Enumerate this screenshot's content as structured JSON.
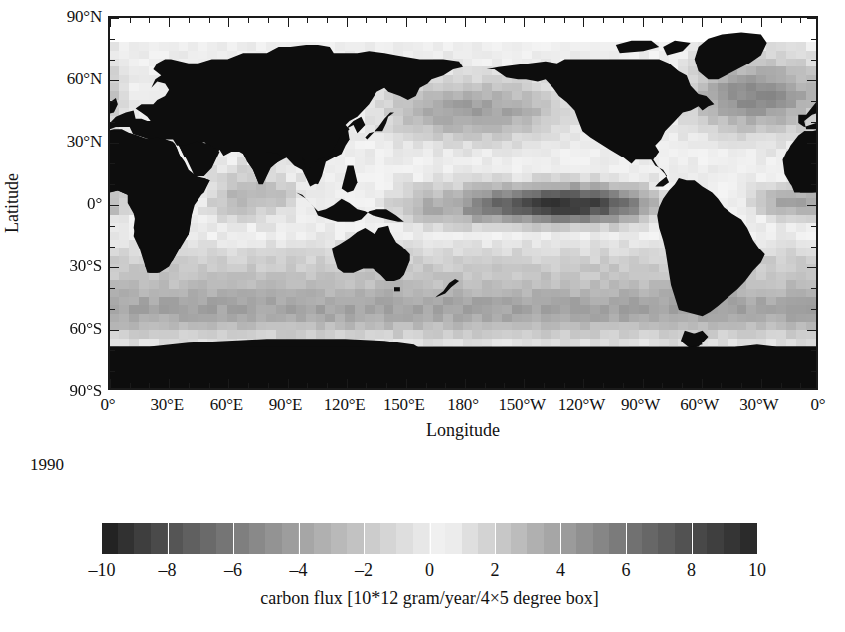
{
  "figure": {
    "year_annotation": "1990"
  },
  "axes": {
    "xlabel": "Longitude",
    "ylabel": "Latitude",
    "xticks": [
      {
        "label": "0°",
        "value": 0
      },
      {
        "label": "30°E",
        "value": 30
      },
      {
        "label": "60°E",
        "value": 60
      },
      {
        "label": "90°E",
        "value": 90
      },
      {
        "label": "120°E",
        "value": 120
      },
      {
        "label": "150°E",
        "value": 150
      },
      {
        "label": "180°",
        "value": 180
      },
      {
        "label": "150°W",
        "value": 210
      },
      {
        "label": "120°W",
        "value": 240
      },
      {
        "label": "90°W",
        "value": 270
      },
      {
        "label": "60°W",
        "value": 300
      },
      {
        "label": "30°W",
        "value": 330
      },
      {
        "label": "0°",
        "value": 360
      }
    ],
    "yticks": [
      {
        "label": "90°N",
        "value": 90
      },
      {
        "label": "60°N",
        "value": 60
      },
      {
        "label": "30°N",
        "value": 30
      },
      {
        "label": "0°",
        "value": 0
      },
      {
        "label": "30°S",
        "value": -30
      },
      {
        "label": "60°S",
        "value": -60
      },
      {
        "label": "90°S",
        "value": -90
      }
    ],
    "xlim": [
      0,
      360
    ],
    "ylim": [
      -90,
      90
    ],
    "minor_tick_interval": 10,
    "major_tick_interval": 30
  },
  "colorbar": {
    "title": "carbon flux [10*12 gram/year/4×5 degree box]",
    "ticks": [
      -10,
      -8,
      -6,
      -4,
      -2,
      0,
      2,
      4,
      6,
      8,
      10
    ],
    "tick_labels": [
      "–10",
      "–8",
      "–6",
      "–4",
      "–2",
      "0",
      "2",
      "4",
      "6",
      "8",
      "10"
    ],
    "vmin": -10,
    "vmax": 10,
    "colormap": "grayscale-diverging",
    "dark_low": "#1c1c1c",
    "light_mid": "#f2f2f2",
    "dark_high": "#2a2a2a"
  },
  "chart_data": {
    "type": "heatmap",
    "title": "",
    "xlabel": "Longitude",
    "ylabel": "Latitude",
    "year": "1990",
    "units": "10*12 gram/year/4×5 degree box",
    "variable": "carbon flux",
    "cell_size_deg": {
      "lat": 4,
      "lon": 5
    },
    "xlim": [
      0,
      360
    ],
    "ylim": [
      -90,
      90
    ],
    "zlim": [
      -10,
      10
    ],
    "grid": false,
    "legend": "colorbar-below",
    "land_mask_color": "#0d0d0d",
    "nodata_color": "#ffffff",
    "regions": [
      {
        "name": "equatorial-pacific-outgassing",
        "lon": [
          180,
          280
        ],
        "lat": [
          -12,
          10
        ],
        "value": 7.5
      },
      {
        "name": "eastern-equatorial-pacific-peak",
        "lon": [
          230,
          275
        ],
        "lat": [
          -8,
          6
        ],
        "value": 9.0
      },
      {
        "name": "western-equatorial-pacific",
        "lon": [
          160,
          200
        ],
        "lat": [
          -10,
          8
        ],
        "value": 4.5
      },
      {
        "name": "equatorial-atlantic-outgassing",
        "lon": [
          330,
          360
        ],
        "lat": [
          -10,
          6
        ],
        "value": 3.0
      },
      {
        "name": "equatorial-indian-ocean",
        "lon": [
          50,
          100
        ],
        "lat": [
          -12,
          8
        ],
        "value": 2.0
      },
      {
        "name": "north-atlantic-uptake",
        "lon": [
          300,
          360
        ],
        "lat": [
          35,
          70
        ],
        "value": -5.0
      },
      {
        "name": "north-pacific-uptake",
        "lon": [
          140,
          230
        ],
        "lat": [
          32,
          62
        ],
        "value": -4.0
      },
      {
        "name": "southern-ocean-uptake",
        "lon": [
          0,
          360
        ],
        "lat": [
          -65,
          -40
        ],
        "value": -3.5
      },
      {
        "name": "subtropical-south-pacific",
        "lon": [
          180,
          280
        ],
        "lat": [
          -40,
          -18
        ],
        "value": -2.0
      },
      {
        "name": "subtropical-south-atlantic",
        "lon": [
          320,
          360
        ],
        "lat": [
          -40,
          -15
        ],
        "value": -1.5
      },
      {
        "name": "arabian-sea",
        "lon": [
          50,
          75
        ],
        "lat": [
          5,
          25
        ],
        "value": 2.5
      },
      {
        "name": "subtropical-gyres-neutral",
        "lon": [
          0,
          360
        ],
        "lat": [
          -18,
          28
        ],
        "value": 0.5
      },
      {
        "name": "arctic-ocean-nodata",
        "lon": [
          0,
          360
        ],
        "lat": [
          78,
          90
        ],
        "value": null
      }
    ]
  }
}
